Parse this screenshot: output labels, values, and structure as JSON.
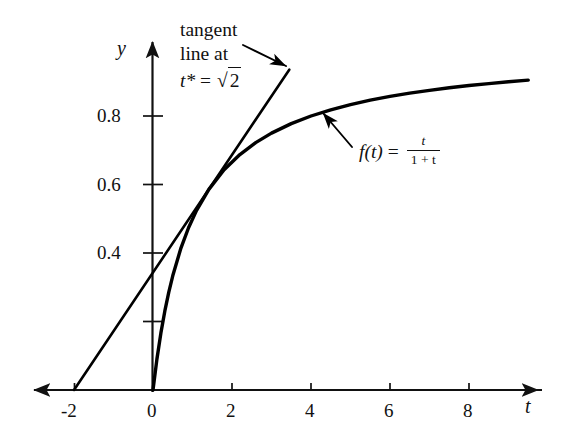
{
  "figure": {
    "background_color": "#ffffff",
    "ink_color": "#111111"
  },
  "axes": {
    "x_axis_label": "t",
    "y_axis_label": "y",
    "x_tick_labels": [
      "-2",
      "0",
      "2",
      "4",
      "6",
      "8"
    ],
    "x_tick_values": [
      -2,
      0,
      2,
      4,
      6,
      8
    ],
    "y_tick_labels": [
      "0.8",
      "0.6",
      "0.4"
    ],
    "y_tick_values": [
      0.8,
      0.6,
      0.4
    ],
    "y_unlabeled_tick_values": [
      0.2
    ]
  },
  "annotations": {
    "tangent_note": {
      "line1": "tangent",
      "line2": "line at",
      "line3_lhs": "t*",
      "line3_eq": "=",
      "line3_radicand": "2"
    },
    "function_label": {
      "name": "f",
      "arg": "(t)",
      "eq": "=",
      "numerator": "t",
      "denominator": "1 + t"
    }
  },
  "chart_data": {
    "type": "line",
    "title": "",
    "xlabel": "t",
    "ylabel": "y",
    "xlim": [
      -2.8,
      10.4
    ],
    "ylim": [
      -0.06,
      1.03
    ],
    "grid": false,
    "legend": "none",
    "series": [
      {
        "name": "f(t) = t/(1+t)",
        "formula": "t/(1+t)",
        "style": "solid",
        "linewidth": 3.4,
        "color": "#000000",
        "x": [
          0,
          0.1,
          0.2,
          0.3,
          0.4,
          0.5,
          0.7,
          0.9,
          1.1,
          1.4142,
          1.8,
          2.2,
          2.6,
          3.0,
          3.5,
          4.0,
          4.5,
          5.0,
          5.5,
          6.0,
          6.5,
          7.0,
          7.5,
          8.0,
          8.5,
          9.0,
          9.5
        ],
        "y": [
          0,
          0.0909,
          0.1667,
          0.2308,
          0.2857,
          0.3333,
          0.4118,
          0.4737,
          0.5238,
          0.5858,
          0.6429,
          0.6875,
          0.7222,
          0.75,
          0.7778,
          0.8,
          0.8182,
          0.8333,
          0.8462,
          0.8571,
          0.8667,
          0.875,
          0.8824,
          0.8889,
          0.8947,
          0.9,
          0.9048
        ]
      },
      {
        "name": "tangent line at t* = sqrt(2)",
        "style": "solid",
        "linewidth": 2.6,
        "color": "#000000",
        "tangent_point": [
          1.4142,
          0.5858
        ],
        "slope": 0.1716,
        "x_intercept": -2,
        "x": [
          -2,
          3.45
        ],
        "y": [
          0,
          0.9352
        ]
      }
    ],
    "annotations": [
      {
        "text": "tangent line at t* = √2",
        "points_to": [
          1.85,
          0.845
        ]
      },
      {
        "text": "f(t) = t/(1 + t)",
        "points_to": [
          4.3,
          0.812
        ]
      }
    ]
  }
}
